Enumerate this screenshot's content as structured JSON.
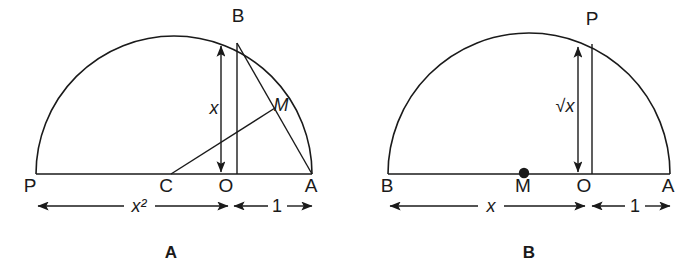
{
  "figure": {
    "panels": [
      {
        "id": "panel-a",
        "caption": "A",
        "baseline_points": [
          {
            "name": "P",
            "label": "P"
          },
          {
            "name": "C",
            "label": "C"
          },
          {
            "name": "O",
            "label": "O"
          },
          {
            "name": "A",
            "label": "A"
          }
        ],
        "arc_points": [
          {
            "name": "B",
            "label": "B"
          },
          {
            "name": "M",
            "label": "M"
          }
        ],
        "vertical_measure": {
          "label": "x",
          "italic": true
        },
        "dimensions": [
          {
            "name": "base-left",
            "label": "x²",
            "from": "P",
            "to": "O",
            "italic": true
          },
          {
            "name": "base-right",
            "label": "1",
            "from": "O",
            "to": "A",
            "italic": false
          }
        ]
      },
      {
        "id": "panel-b",
        "caption": "B",
        "baseline_points": [
          {
            "name": "B",
            "label": "B"
          },
          {
            "name": "M",
            "label": "M"
          },
          {
            "name": "O",
            "label": "O"
          },
          {
            "name": "A",
            "label": "A"
          }
        ],
        "arc_points": [
          {
            "name": "P",
            "label": "P"
          }
        ],
        "vertical_measure": {
          "label": "√x",
          "italic": true
        },
        "dimensions": [
          {
            "name": "base-left",
            "label": "x",
            "from": "B",
            "to": "O",
            "italic": true
          },
          {
            "name": "base-right",
            "label": "1",
            "from": "O",
            "to": "A",
            "italic": false
          }
        ]
      }
    ],
    "colors": {
      "ink": "#1a1a1a",
      "background": "#ffffff"
    }
  }
}
